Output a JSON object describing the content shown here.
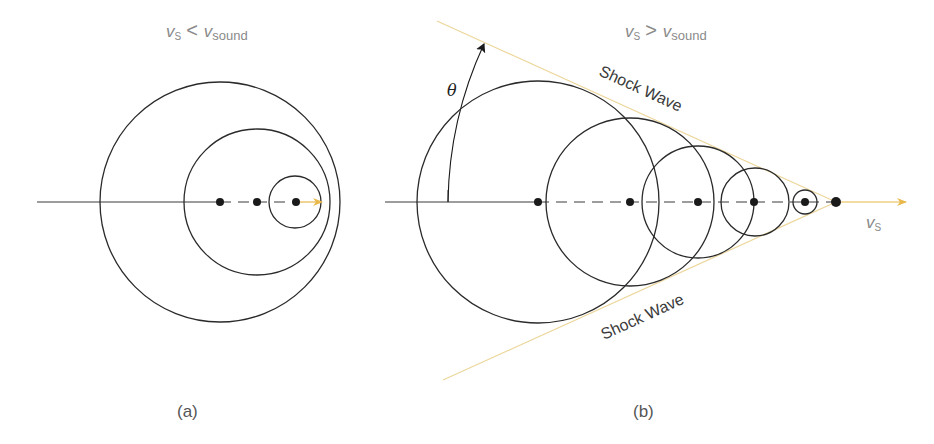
{
  "panel_a": {
    "title_v": "v",
    "title_sub_s": "S",
    "title_op": "<",
    "title_v2": "v",
    "title_sub_sound": "sound",
    "caption": "(a)",
    "circles": [
      {
        "cx": 220,
        "cy": 202,
        "r": 120
      },
      {
        "cx": 257,
        "cy": 202,
        "r": 73
      },
      {
        "cx": 295,
        "cy": 202,
        "r": 26
      }
    ],
    "sources": [
      220,
      257,
      296
    ]
  },
  "panel_b": {
    "title_v": "v",
    "title_sub_s": "S",
    "title_op": ">",
    "title_v2": "v",
    "title_sub_sound": "sound",
    "caption": "(b)",
    "shock_upper_label": "Shock Wave",
    "shock_lower_label": "Shock Wave",
    "angle_label": "θ",
    "velocity_label_v": "v",
    "velocity_label_sub": "S",
    "circles": [
      {
        "cx": 538,
        "cy": 202,
        "r": 121
      },
      {
        "cx": 630,
        "cy": 202,
        "r": 84
      },
      {
        "cx": 698,
        "cy": 202,
        "r": 56
      },
      {
        "cx": 755,
        "cy": 202,
        "r": 34
      },
      {
        "cx": 805,
        "cy": 202,
        "r": 12
      }
    ],
    "sources": [
      538,
      630,
      698,
      754,
      805,
      836
    ]
  },
  "colors": {
    "shock_line": "#ecd69a",
    "velocity_arrow": "#e8b84a",
    "wavefront": "#2a2a2a",
    "label_gray": "#8a8a8a"
  }
}
